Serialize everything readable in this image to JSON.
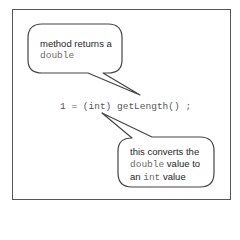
{
  "code_line": {
    "text": "1 = (int) getLength() ;"
  },
  "callouts": [
    {
      "id": "method-returns",
      "lines": [
        [
          {
            "text": "method returns a",
            "mono": false
          }
        ],
        [
          {
            "text": "double",
            "mono": true
          }
        ]
      ]
    },
    {
      "id": "cast-explanation",
      "lines": [
        [
          {
            "text": "this converts the",
            "mono": false
          }
        ],
        [
          {
            "text": "double",
            "mono": true
          },
          {
            "text": " value to",
            "mono": false
          }
        ],
        [
          {
            "text": "an ",
            "mono": false
          },
          {
            "text": "int",
            "mono": true
          },
          {
            "text": " value",
            "mono": false
          }
        ]
      ]
    }
  ],
  "text": {
    "c1_l1": "method returns a",
    "c1_l2": "double",
    "c2_l1": "this converts the",
    "c2_l2_mono": "double",
    "c2_l2_rest": " value to",
    "c2_l3_a": "an ",
    "c2_l3_mono": "int",
    "c2_l3_rest": " value"
  },
  "colors": {
    "frame": "#555555",
    "bubble_stroke": "#444444",
    "text": "#1e1e1e",
    "mono_text": "#6a6a6a"
  }
}
